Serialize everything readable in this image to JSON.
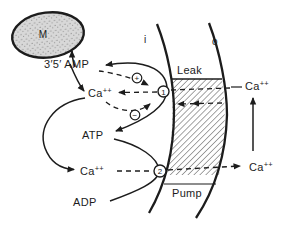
{
  "figure": {
    "colors": {
      "ink": "#1c1c1c",
      "background": "#ffffff",
      "organelle_fill": "#d8d8d8",
      "hatch_line": "#4a4a4a"
    },
    "labels": {
      "mitochondrion": "M",
      "cyclic_amp": "3′5′ AMP",
      "ca_base": "Ca",
      "ca_sup": "++",
      "atp": "ATP",
      "adp": "ADP",
      "leak": "Leak",
      "pump": "Pump",
      "inside": "i",
      "outside": "o",
      "site_leak": "1",
      "site_pump": "2",
      "stimulation_sign": "+",
      "inhibition_sign": "−"
    }
  }
}
